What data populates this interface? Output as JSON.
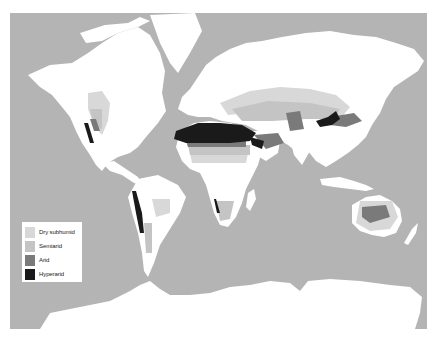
{
  "map": {
    "title": "",
    "colors": {
      "ocean": "#b4b4b4",
      "land": "#ffffff",
      "dry_subhumid": "#d8d8d8",
      "semiarid": "#c4c4c4",
      "arid": "#7a7a7a",
      "hyperarid": "#1a1a1a"
    }
  },
  "legend": {
    "items": [
      {
        "label": "Dry subhumid",
        "color": "#d8d8d8"
      },
      {
        "label": "Semiarid",
        "color": "#c4c4c4"
      },
      {
        "label": "Arid",
        "color": "#7a7a7a"
      },
      {
        "label": "Hyperarid",
        "color": "#1a1a1a"
      }
    ]
  }
}
